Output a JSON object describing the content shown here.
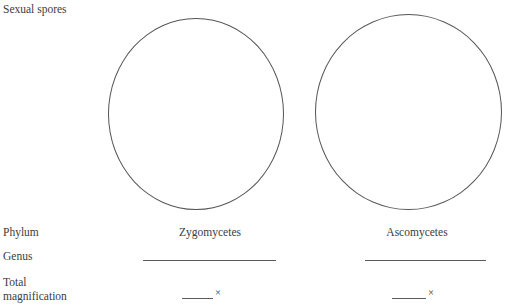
{
  "worksheet": {
    "top_label": "Sexual spores",
    "row_labels": {
      "phylum": "Phylum",
      "genus": "Genus",
      "total_line1": "Total",
      "total_line2": "magnification"
    },
    "columns": [
      {
        "phylum": "Zygomycetes",
        "genus_value": "",
        "total_magnification_value": "",
        "magnification_symbol": "×"
      },
      {
        "phylum": "Ascomycetes",
        "genus_value": "",
        "total_magnification_value": "",
        "magnification_symbol": "×"
      }
    ],
    "colors": {
      "text": "#3c3c3c",
      "rule": "#5a5a5a",
      "circle_outline": "#555555",
      "background": "#ffffff"
    }
  }
}
